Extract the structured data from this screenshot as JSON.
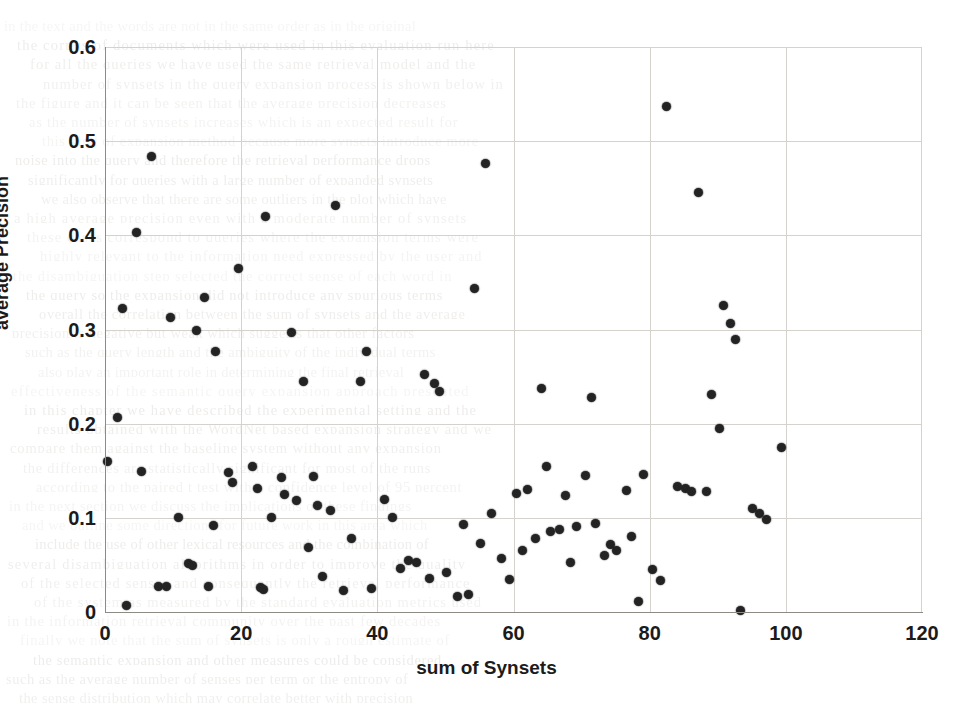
{
  "chart_data": {
    "type": "scatter",
    "title": "",
    "xlabel": "sum of Synsets",
    "ylabel": "average Precision",
    "xlim": [
      0,
      120
    ],
    "ylim": [
      0,
      0.6
    ],
    "xticks": [
      0,
      20,
      40,
      60,
      80,
      100,
      120
    ],
    "yticks": [
      "0",
      "0.1",
      "0.2",
      "0.3",
      "0.4",
      "0.5",
      "0.6"
    ],
    "ytick_values": [
      0,
      0.1,
      0.2,
      0.3,
      0.4,
      0.5,
      0.6
    ],
    "grid": true,
    "legend": null,
    "marker": {
      "shape": "circle",
      "color": "#232323",
      "size": 9
    },
    "series": [
      {
        "name": "average Precision vs sum of Synsets",
        "points": [
          [
            0.4,
            0.16
          ],
          [
            1.8,
            0.207
          ],
          [
            2.6,
            0.322
          ],
          [
            3.2,
            0.007
          ],
          [
            4.6,
            0.403
          ],
          [
            5.4,
            0.149
          ],
          [
            6.9,
            0.484
          ],
          [
            7.8,
            0.027
          ],
          [
            9.1,
            0.027
          ],
          [
            9.6,
            0.313
          ],
          [
            10.8,
            0.1
          ],
          [
            12.3,
            0.051
          ],
          [
            12.9,
            0.049
          ],
          [
            13.4,
            0.299
          ],
          [
            14.6,
            0.334
          ],
          [
            15.2,
            0.027
          ],
          [
            15.9,
            0.092
          ],
          [
            16.2,
            0.277
          ],
          [
            18.1,
            0.148
          ],
          [
            18.8,
            0.138
          ],
          [
            19.6,
            0.365
          ],
          [
            21.6,
            0.155
          ],
          [
            22.4,
            0.131
          ],
          [
            22.8,
            0.026
          ],
          [
            23.3,
            0.024
          ],
          [
            23.6,
            0.42
          ],
          [
            24.4,
            0.1
          ],
          [
            25.9,
            0.143
          ],
          [
            26.3,
            0.125
          ],
          [
            27.4,
            0.297
          ],
          [
            28.1,
            0.118
          ],
          [
            29.1,
            0.245
          ],
          [
            29.9,
            0.068
          ],
          [
            30.6,
            0.144
          ],
          [
            31.2,
            0.113
          ],
          [
            31.9,
            0.038
          ],
          [
            33.1,
            0.108
          ],
          [
            33.8,
            0.432
          ],
          [
            35.1,
            0.023
          ],
          [
            36.2,
            0.078
          ],
          [
            37.6,
            0.245
          ],
          [
            38.4,
            0.277
          ],
          [
            39.2,
            0.025
          ],
          [
            41.1,
            0.119
          ],
          [
            42.3,
            0.1
          ],
          [
            43.4,
            0.046
          ],
          [
            44.6,
            0.055
          ],
          [
            45.8,
            0.053
          ],
          [
            46.9,
            0.252
          ],
          [
            47.6,
            0.036
          ],
          [
            48.4,
            0.243
          ],
          [
            49.1,
            0.234
          ],
          [
            50.2,
            0.042
          ],
          [
            51.8,
            0.016
          ],
          [
            52.6,
            0.093
          ],
          [
            53.4,
            0.019
          ],
          [
            54.2,
            0.344
          ],
          [
            55.1,
            0.073
          ],
          [
            55.9,
            0.476
          ],
          [
            56.8,
            0.105
          ],
          [
            58.2,
            0.057
          ],
          [
            59.4,
            0.035
          ],
          [
            60.4,
            0.126
          ],
          [
            61.3,
            0.065
          ],
          [
            62.1,
            0.13
          ],
          [
            63.2,
            0.078
          ],
          [
            64.1,
            0.237
          ],
          [
            64.8,
            0.154
          ],
          [
            65.4,
            0.085
          ],
          [
            66.7,
            0.088
          ],
          [
            67.6,
            0.124
          ],
          [
            68.4,
            0.053
          ],
          [
            69.3,
            0.091
          ],
          [
            70.6,
            0.145
          ],
          [
            71.4,
            0.228
          ],
          [
            72.1,
            0.094
          ],
          [
            73.4,
            0.06
          ],
          [
            74.2,
            0.072
          ],
          [
            75.1,
            0.065
          ],
          [
            76.6,
            0.129
          ],
          [
            77.4,
            0.08
          ],
          [
            78.3,
            0.011
          ],
          [
            79.1,
            0.146
          ],
          [
            80.4,
            0.045
          ],
          [
            81.6,
            0.033
          ],
          [
            82.4,
            0.537
          ],
          [
            84.1,
            0.133
          ],
          [
            85.3,
            0.131
          ],
          [
            86.1,
            0.128
          ],
          [
            87.2,
            0.445
          ],
          [
            88.4,
            0.128
          ],
          [
            89.1,
            0.231
          ],
          [
            90.2,
            0.195
          ],
          [
            90.9,
            0.326
          ],
          [
            91.8,
            0.306
          ],
          [
            92.6,
            0.289
          ],
          [
            93.4,
            0.002
          ],
          [
            95.1,
            0.11
          ],
          [
            96.2,
            0.105
          ],
          [
            97.1,
            0.098
          ],
          [
            99.4,
            0.175
          ]
        ]
      }
    ]
  },
  "bleed_text": {
    "lines": [
      "in the text and the words are not in the same order as in the original",
      "the corpus of documents which were used in this evaluation run here",
      "for all the queries we have used the same retrieval model and the",
      "number of synsets in the query expansion process is shown below in",
      "the figure and it can be seen that the average precision decreases",
      "as the number of synsets increases which is an expected result for",
      "this kind of expansion method because more synsets introduce more",
      "noise into the query and therefore the retrieval performance drops",
      "significantly for queries with a large number of expanded synsets",
      "we also observe that there are some outliers in the plot which have",
      "a high average precision even with a moderate number of synsets",
      "these cases correspond to queries where the expansion terms were",
      "highly relevant to the information need expressed by the user and",
      "the disambiguation step selected the correct sense of each word in",
      "the query so the expansion did not introduce any spurious terms",
      "overall the correlation between the sum of synsets and the average",
      "precision is negative but weak which suggests that other factors",
      "such as the query length and the ambiguity of the individual terms",
      "also play an important role in determining the final retrieval",
      "effectiveness of the semantic query expansion approach presented",
      "in this chapter we have described the experimental setting and the",
      "results obtained with the WordNet based expansion strategy and we",
      "compare them against the baseline system without any expansion",
      "the differences are statistically significant for most of the runs",
      "according to the paired t test with a confidence level of 95 percent",
      "in the next section we discuss the implications of these findings",
      "and we outline some directions for future work in this area which",
      "include the use of other lexical resources and the combination of",
      "several disambiguation algorithms in order to improve the quality",
      "of the selected senses and consequently the retrieval performance",
      "of the system as measured by the standard evaluation metrics used",
      "in the information retrieval community over the past few decades",
      "finally we note that the sum of synsets is only a rough estimate of",
      "the semantic expansion and other measures could be considered",
      "such as the average number of senses per term or the entropy of",
      "the sense distribution which may correlate better with precision"
    ]
  }
}
